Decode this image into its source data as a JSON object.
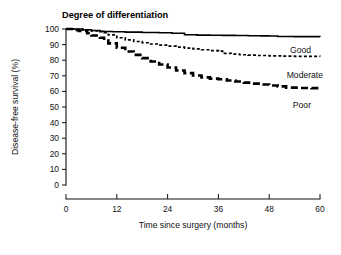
{
  "chart_data": {
    "type": "line",
    "title": "Degree of differentiation",
    "subtitle": "",
    "xlabel": "Time since surgery (months)",
    "ylabel": "Disease-free survival (%)",
    "xlim": [
      0,
      60
    ],
    "ylim": [
      0,
      100
    ],
    "xticks": [
      0,
      12,
      24,
      36,
      48,
      60
    ],
    "yticks": [
      0,
      10,
      20,
      30,
      40,
      50,
      60,
      70,
      80,
      90,
      100
    ],
    "grid": false,
    "legend_position": "inline-right-of-curves",
    "style": "Kaplan-Meier step curves",
    "series": [
      {
        "name": "Good",
        "label": "Good",
        "line_style": "solid",
        "line_width": 1.6,
        "color": "#000000",
        "x": [
          0,
          2,
          4,
          6,
          8,
          9,
          11,
          14,
          18,
          22,
          25,
          28,
          31,
          34,
          37,
          40,
          43,
          46,
          48,
          50,
          54,
          57,
          60
        ],
        "y": [
          100,
          100,
          99.5,
          99.0,
          98.6,
          98.4,
          98.2,
          98.0,
          97.8,
          97.6,
          97.3,
          96.3,
          96.1,
          96.0,
          95.9,
          95.8,
          95.7,
          95.6,
          95.5,
          95.2,
          95.1,
          95.1,
          95.0
        ]
      },
      {
        "name": "Moderate",
        "label": "Moderate",
        "line_style": "dashed-fine",
        "line_width": 1.7,
        "dash_pattern": "3,2.2",
        "color": "#000000",
        "x": [
          0,
          2,
          4,
          6,
          8,
          9,
          10,
          12,
          14,
          16,
          18,
          20,
          22,
          24,
          26,
          28,
          30,
          32,
          34,
          36,
          37,
          39,
          41,
          43,
          45,
          48,
          51,
          54,
          57,
          60
        ],
        "y": [
          100,
          99.6,
          99.2,
          98.8,
          98.3,
          97.6,
          96.2,
          94.4,
          93.0,
          92.0,
          91.2,
          90.4,
          89.7,
          89.0,
          88.4,
          87.8,
          87.2,
          86.7,
          86.2,
          85.8,
          84.4,
          83.9,
          83.5,
          83.2,
          83.0,
          82.8,
          82.6,
          82.5,
          82.4,
          82.3
        ]
      },
      {
        "name": "Poor",
        "label": "Poor",
        "line_style": "dashed-heavy",
        "line_width": 2.6,
        "dash_pattern": "7,3.5",
        "color": "#000000",
        "x": [
          0,
          2,
          3,
          5,
          6,
          8,
          9,
          10,
          12,
          14,
          16,
          18,
          20,
          22,
          24,
          26,
          28,
          30,
          32,
          34,
          36,
          38,
          40,
          42,
          44,
          46,
          48,
          50,
          52,
          55,
          58,
          60
        ],
        "y": [
          100,
          99.4,
          98.7,
          97.3,
          95.8,
          94.4,
          92.6,
          90.8,
          88.0,
          85.6,
          83.4,
          81.3,
          79.2,
          77.2,
          75.3,
          73.4,
          71.7,
          70.2,
          69.0,
          68.2,
          67.8,
          67.0,
          66.3,
          65.6,
          65.0,
          64.4,
          63.8,
          63.2,
          62.4,
          62.2,
          62.1,
          62.0
        ]
      }
    ]
  },
  "labels": {
    "good": "Good",
    "moderate": "Moderate",
    "poor": "Poor"
  }
}
